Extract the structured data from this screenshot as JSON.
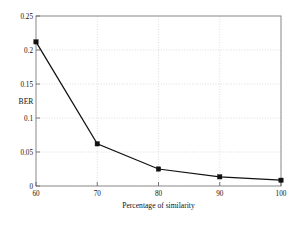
{
  "chart_data": {
    "type": "line",
    "title": "",
    "subtitle": "",
    "xlabel": "Percentage of similarity",
    "ylabel": "BER",
    "x": [
      60,
      70,
      80,
      90,
      100
    ],
    "values": [
      0.212,
      0.062,
      0.025,
      0.0135,
      0.0085
    ],
    "series": [
      {
        "name": "BER",
        "values": [
          0.212,
          0.062,
          0.025,
          0.0135,
          0.0085
        ]
      }
    ],
    "xlim": [
      60,
      100
    ],
    "ylim": [
      0,
      0.25
    ],
    "xticks": [
      60,
      70,
      80,
      90,
      100
    ],
    "yticks": [
      0,
      0.05,
      0.1,
      0.15,
      0.2,
      0.25
    ],
    "xtick_labels": [
      "60",
      "70",
      "80",
      "90",
      "100"
    ],
    "ytick_labels": [
      "0",
      "0.05",
      "0.1",
      "0.15",
      "0.2",
      "0.25"
    ],
    "grid": true,
    "legend": false,
    "legend_position": "none",
    "marker": "square",
    "line_color": "#111111",
    "marker_color": "#111111",
    "grid_color": "#c8c8c8",
    "frame_color": "#8d8d8d",
    "background_color": "#ffffff"
  }
}
